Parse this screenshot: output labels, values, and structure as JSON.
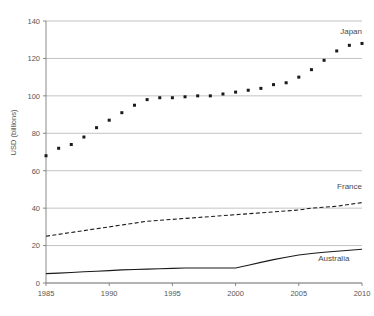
{
  "chart_data": {
    "type": "line",
    "title": "",
    "xlabel": "",
    "ylabel": "USD (billions)",
    "xlim": [
      1985,
      2010
    ],
    "ylim": [
      0,
      140
    ],
    "grid": true,
    "legend_position": "inline-right",
    "y_ticks": [
      0,
      20,
      40,
      60,
      80,
      100,
      120,
      140
    ],
    "x_ticks": [
      1985,
      1990,
      1995,
      2000,
      2005,
      2010
    ],
    "x": [
      1985,
      1986,
      1987,
      1988,
      1989,
      1990,
      1991,
      1992,
      1993,
      1994,
      1995,
      1996,
      1997,
      1998,
      1999,
      2000,
      2001,
      2002,
      2003,
      2004,
      2005,
      2006,
      2007,
      2008,
      2009,
      2010
    ],
    "series": [
      {
        "name": "Japan",
        "style": "dotted",
        "marker": "square",
        "color": "#1a1a1a",
        "values": [
          68,
          72,
          74,
          78,
          83,
          87,
          91,
          95,
          98,
          99,
          99,
          99.5,
          100,
          100,
          101,
          102,
          103,
          104,
          106,
          107,
          110,
          114,
          119,
          124,
          127,
          128
        ]
      },
      {
        "name": "France",
        "style": "dashed",
        "marker": "none",
        "color": "#1a1a1a",
        "values": [
          25,
          26,
          27,
          28,
          29,
          30,
          31,
          32,
          33,
          33.5,
          34,
          34.5,
          35,
          35.5,
          36,
          36.5,
          37,
          37.5,
          38,
          38.5,
          39,
          40,
          40.5,
          41,
          42,
          43
        ]
      },
      {
        "name": "Australia",
        "style": "solid",
        "marker": "none",
        "color": "#1a1a1a",
        "values": [
          5,
          5.3,
          5.6,
          6,
          6.3,
          6.6,
          7,
          7.2,
          7.4,
          7.6,
          7.8,
          8,
          8,
          8,
          8,
          8,
          9.5,
          11,
          12.5,
          13.8,
          15,
          15.8,
          16.4,
          17,
          17.5,
          18
        ]
      }
    ],
    "series_label_positions": [
      {
        "name": "Japan",
        "x": 2010,
        "y": 133
      },
      {
        "name": "France",
        "x": 2010,
        "y": 50
      },
      {
        "name": "Australia",
        "x": 2009,
        "y": 12
      }
    ]
  }
}
